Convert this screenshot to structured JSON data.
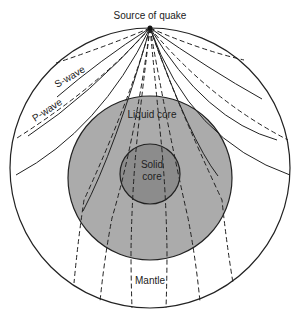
{
  "labels": {
    "source": "Source of quake",
    "s_wave": "S-wave",
    "p_wave": "P-wave",
    "liquid_core": "Liquid core",
    "solid_core_line1": "Solid",
    "solid_core_line2": "core",
    "mantle": "Mantle"
  },
  "colors": {
    "liquid_core": "#ababab",
    "solid_core": "#8c8c8c",
    "outline": "#222222"
  }
}
